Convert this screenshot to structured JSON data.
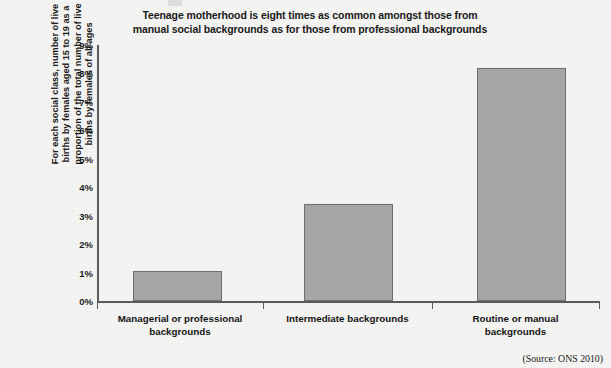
{
  "chart_data": {
    "type": "bar",
    "title": "Teenage motherhood is eight times as common amongst those from manual social backgrounds as for those from professional backgrounds",
    "title_lines": [
      "Teenage motherhood is eight times as common amongst those from",
      "manual social backgrounds as for those from professional backgrounds"
    ],
    "categories": [
      "Managerial or professional backgrounds",
      "Intermediate backgrounds",
      "Routine or manual backgrounds"
    ],
    "category_lines": [
      [
        "Managerial or professional",
        "backgrounds"
      ],
      [
        "Intermediate backgrounds"
      ],
      [
        "Routine or manual",
        "backgrounds"
      ]
    ],
    "values": [
      1.05,
      3.4,
      8.2
    ],
    "value_labels": [
      "1.05%",
      "3.4%",
      "8.2%"
    ],
    "xlabel": "",
    "ylabel": "For each social class, number of live births by females aged 15 to 19 as a proportion of the total number of live births by females of all ages",
    "ylabel_lines": [
      "For each social class, number of live",
      "births by females aged 15 to 19 as a",
      "proportion of the total number of live",
      "births by females of all ages"
    ],
    "ylim": [
      0,
      9
    ],
    "ytick_values": [
      0,
      1,
      2,
      3,
      4,
      5,
      6,
      7,
      8,
      9
    ],
    "ytick_labels": [
      "0%",
      "1%",
      "2%",
      "3%",
      "4%",
      "5%",
      "6%",
      "7%",
      "8%",
      "9%"
    ],
    "grid": false,
    "legend": false,
    "legend_position": "none",
    "bar_fill_color": "#a6a6a6",
    "bar_edge_color": "#6e6e6e",
    "axis_color": "#5a5a5a",
    "background_color": "#f4f4f2"
  },
  "source": {
    "text": "(Source: ONS 2010)"
  }
}
